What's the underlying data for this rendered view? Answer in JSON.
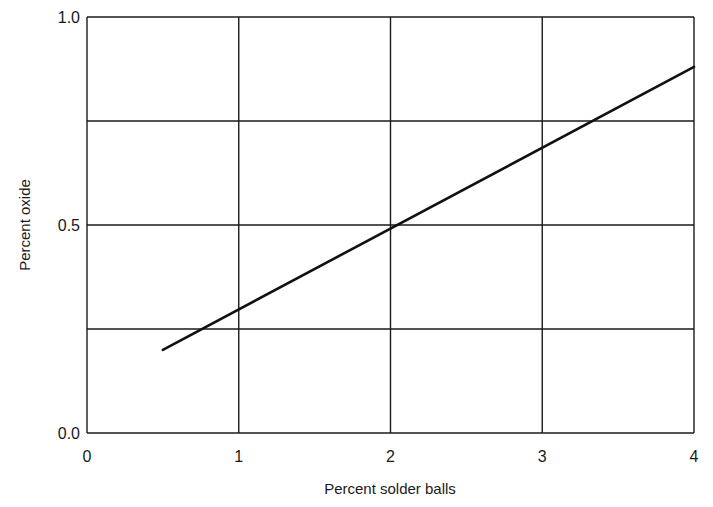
{
  "chart_data": {
    "type": "line",
    "title": "",
    "xlabel": "Percent solder balls",
    "ylabel": "Percent oxide",
    "xlim": [
      0,
      4
    ],
    "ylim": [
      0.0,
      1.0
    ],
    "x_ticks": [
      "0",
      "1",
      "2",
      "3",
      "4"
    ],
    "y_ticks": [
      "0.0",
      "0.5",
      "1.0"
    ],
    "x_grid": [
      0,
      1,
      2,
      3,
      4
    ],
    "y_grid": [
      0.0,
      0.25,
      0.5,
      0.75,
      1.0
    ],
    "grid": true,
    "legend": null,
    "series": [
      {
        "name": "oxide vs solder balls",
        "x": [
          0.5,
          1.0,
          2.0,
          3.0,
          4.0
        ],
        "y": [
          0.2,
          0.29,
          0.49,
          0.68,
          0.88
        ]
      }
    ]
  },
  "colors": {
    "line": "#111111",
    "grid": "#1a1a1a",
    "background": "#ffffff"
  }
}
